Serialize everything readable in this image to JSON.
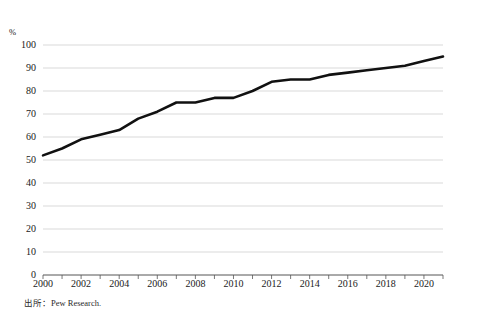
{
  "figure": {
    "clipped_header": "",
    "source_note": "出所：Pew Research.",
    "y_unit_label": "%"
  },
  "chart_data": {
    "type": "line",
    "title": "",
    "subtitle": "",
    "xlabel": "",
    "ylabel": "%",
    "xlim": [
      2000,
      2021
    ],
    "ylim": [
      0,
      100
    ],
    "grid": "horizontal",
    "legend": "none",
    "line_color": "#111111",
    "gridline_color": "#c8c8c8",
    "y_ticks": [
      0,
      10,
      20,
      30,
      40,
      50,
      60,
      70,
      80,
      90,
      100
    ],
    "y_tick_labels": [
      "0",
      "10",
      "20",
      "30",
      "40",
      "50",
      "60",
      "70",
      "80",
      "90",
      "100"
    ],
    "x_ticks": [
      2000,
      2001,
      2002,
      2003,
      2004,
      2005,
      2006,
      2007,
      2008,
      2009,
      2010,
      2011,
      2012,
      2013,
      2014,
      2015,
      2016,
      2017,
      2018,
      2019,
      2020,
      2021
    ],
    "x_tick_labels_shown": [
      "2000",
      "2002",
      "2004",
      "2006",
      "2008",
      "2010",
      "2012",
      "2014",
      "2016",
      "2018",
      "2020"
    ],
    "x_tick_label_values": [
      2000,
      2002,
      2004,
      2006,
      2008,
      2010,
      2012,
      2014,
      2016,
      2018,
      2020
    ],
    "x": [
      2000,
      2001,
      2002,
      2003,
      2004,
      2005,
      2006,
      2007,
      2008,
      2009,
      2010,
      2011,
      2012,
      2013,
      2014,
      2015,
      2016,
      2017,
      2018,
      2019,
      2020,
      2021
    ],
    "values": [
      52,
      55,
      59,
      61,
      63,
      68,
      71,
      75,
      75,
      77,
      77,
      80,
      84,
      85,
      85,
      87,
      88,
      89,
      90,
      91,
      93,
      95
    ],
    "series": [
      {
        "name": "",
        "values": [
          52,
          55,
          59,
          61,
          63,
          68,
          71,
          75,
          75,
          77,
          77,
          80,
          84,
          85,
          85,
          87,
          88,
          89,
          90,
          91,
          93,
          95
        ]
      }
    ]
  }
}
